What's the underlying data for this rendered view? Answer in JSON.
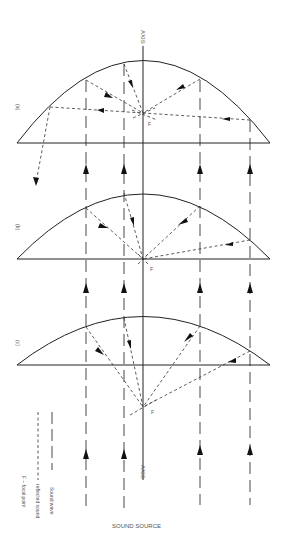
{
  "diagram": {
    "axis_label_top": "AXIS",
    "axis_label_bottom": "AXIS",
    "source_label": "SOUND SOURCE",
    "focal_label": "F",
    "panels": [
      {
        "id": "a",
        "label": "(a)",
        "description": "deep parabola - focal point inside reflector; one reflected ray escapes"
      },
      {
        "id": "b",
        "label": "(b)",
        "description": "medium parabola - focal point at reflector opening plane"
      },
      {
        "id": "c",
        "label": "(c)",
        "description": "shallow parabola - focal point outside reflector"
      }
    ],
    "legend": [
      {
        "style": "long-dash",
        "label": "Sound wave"
      },
      {
        "style": "short-dash",
        "label": "reflected sound"
      },
      {
        "style": "text",
        "label": "F – focal point"
      }
    ],
    "colors": {
      "line": "#222222",
      "background": "#ffffff"
    }
  }
}
